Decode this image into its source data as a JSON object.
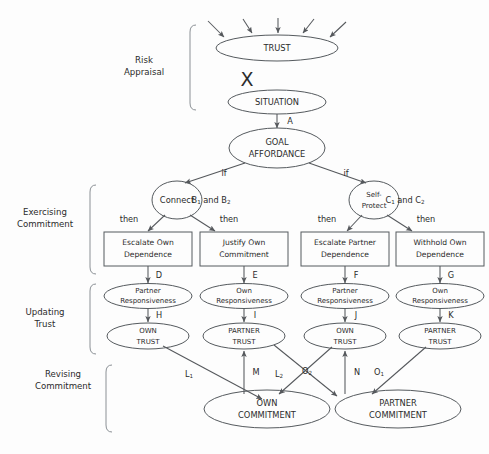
{
  "figure": {
    "background_color": "#fdfdfd",
    "stroke_color": "#55585c",
    "text_color": "#2b2b2b",
    "x_operator": "X"
  },
  "sections": [
    {
      "id": "risk-appraisal",
      "line1": "Risk",
      "line2": "Appraisal"
    },
    {
      "id": "exercising-commitment",
      "line1": "Exercising",
      "line2": "Commitment"
    },
    {
      "id": "updating-trust",
      "line1": "Updating",
      "line2": "Trust"
    },
    {
      "id": "revising-commitment",
      "line1": "Revising",
      "line2": "Commitment"
    }
  ],
  "nodes": {
    "trust": {
      "label": "TRUST",
      "shape": "ellipse"
    },
    "situation": {
      "label": "SITUATION",
      "shape": "ellipse"
    },
    "goal_affordance": {
      "line1": "GOAL",
      "line2": "AFFORDANCE",
      "shape": "ellipse"
    },
    "connect": {
      "label": "Connect",
      "shape": "circle"
    },
    "self_protect": {
      "line1": "Self-",
      "line2": "Protect",
      "shape": "circle"
    },
    "escalate_own_dependence": {
      "line1": "Escalate Own",
      "line2": "Dependence",
      "shape": "rect"
    },
    "justify_own_commitment": {
      "line1": "Justify Own",
      "line2": "Commitment",
      "shape": "rect"
    },
    "escalate_partner_dependence": {
      "line1": "Escalate Partner",
      "line2": "Dependence",
      "shape": "rect"
    },
    "withhold_own_dependence": {
      "line1": "Withhold Own",
      "line2": "Dependence",
      "shape": "rect"
    },
    "partner_responsiveness_1": {
      "line1": "Partner",
      "line2": "Responsiveness",
      "shape": "ellipse"
    },
    "own_responsiveness_1": {
      "line1": "Own",
      "line2": "Responsiveness",
      "shape": "ellipse"
    },
    "partner_responsiveness_2": {
      "line1": "Partner",
      "line2": "Responsiveness",
      "shape": "ellipse"
    },
    "own_responsiveness_2": {
      "line1": "Own",
      "line2": "Responsiveness",
      "shape": "ellipse"
    },
    "own_trust_1": {
      "line1": "OWN",
      "line2": "TRUST",
      "shape": "ellipse"
    },
    "partner_trust_1": {
      "line1": "PARTNER",
      "line2": "TRUST",
      "shape": "ellipse"
    },
    "own_trust_2": {
      "line1": "OWN",
      "line2": "TRUST",
      "shape": "ellipse"
    },
    "partner_trust_2": {
      "line1": "PARTNER",
      "line2": "TRUST",
      "shape": "ellipse"
    },
    "own_commitment": {
      "line1": "OWN",
      "line2": "COMMITMENT",
      "shape": "ellipse"
    },
    "partner_commitment": {
      "line1": "PARTNER",
      "line2": "COMMITMENT",
      "shape": "ellipse"
    }
  },
  "edge_labels": {
    "a": "A",
    "if_left": "if",
    "if_right": "if",
    "b_condition": "B",
    "b_condition_sub": "1",
    "b_condition_rest": " and B",
    "b_condition_sub2": "2",
    "c_condition": "C",
    "c_condition_sub": "1",
    "c_condition_rest": " and C",
    "c_condition_sub2": "2",
    "then_1": "then",
    "then_2": "then",
    "then_3": "then",
    "then_4": "then",
    "d": "D",
    "e": "E",
    "f": "F",
    "g": "G",
    "h": "H",
    "i": "I",
    "j": "J",
    "k": "K",
    "l1_base": "L",
    "l1_sub": "1",
    "m": "M",
    "l2_base": "L",
    "l2_sub": "2",
    "o2_base": "O",
    "o2_sub": "2",
    "n": "N",
    "o1_base": "O",
    "o1_sub": "1"
  }
}
